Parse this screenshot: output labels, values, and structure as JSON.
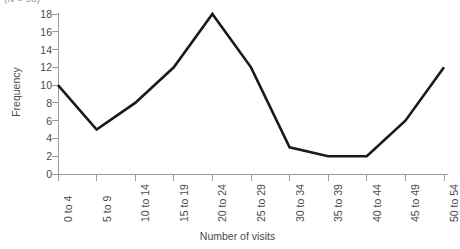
{
  "chart_data": {
    "type": "line",
    "title": "",
    "note": "(N = 98)",
    "xlabel": "Number of visits",
    "ylabel": "Frequency",
    "categories": [
      "0 to 4",
      "5 to 9",
      "10 to 14",
      "15 to 19",
      "20 to 24",
      "25 to 29",
      "30 to 34",
      "35 to 39",
      "40 to 44",
      "45 to 49",
      "50 to 54"
    ],
    "values": [
      10,
      5,
      8,
      12,
      18,
      12,
      3,
      2,
      2,
      6,
      12
    ],
    "ylim": [
      0,
      18
    ],
    "yticks": [
      0,
      2,
      4,
      6,
      8,
      10,
      12,
      14,
      16,
      18
    ],
    "ytick_labels": [
      "0",
      "2",
      "4",
      "6",
      "8",
      "10",
      "12",
      "14",
      "16",
      "18"
    ],
    "grid": false,
    "legend": false,
    "line_color": "#1a1a1a",
    "axis_color": "#9a9a9a",
    "markers": false,
    "xtick_rotation": -90
  }
}
